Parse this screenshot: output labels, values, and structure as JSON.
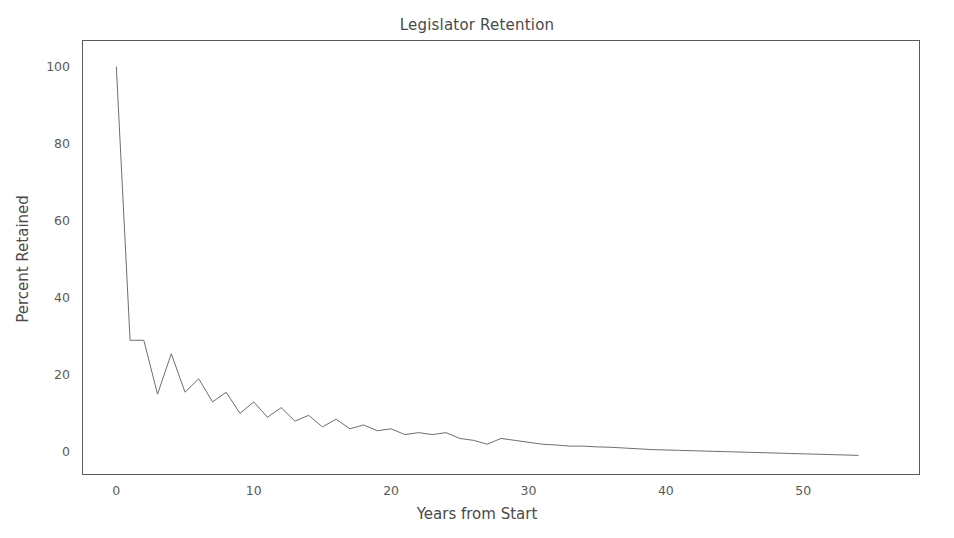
{
  "chart_data": {
    "type": "line",
    "title": "Legislator Retention",
    "xlabel": "Years from Start",
    "ylabel": "Percent Retained",
    "xlim": [
      -2.5,
      58.5
    ],
    "ylim": [
      -6,
      107
    ],
    "grid": false,
    "legend": null,
    "line_color": "#6e6e6e",
    "line_width": 1,
    "xticks": [
      0,
      10,
      20,
      30,
      40,
      50
    ],
    "xtick_labels": [
      "0",
      "10",
      "20",
      "30",
      "40",
      "50"
    ],
    "yticks": [
      0,
      20,
      40,
      60,
      80,
      100
    ],
    "ytick_labels": [
      "0",
      "20",
      "40",
      "60",
      "80",
      "100"
    ],
    "series": [
      {
        "name": "Percent Retained",
        "x": [
          0,
          1,
          2,
          3,
          4,
          5,
          6,
          7,
          8,
          9,
          10,
          11,
          12,
          13,
          14,
          15,
          16,
          17,
          18,
          19,
          20,
          21,
          22,
          23,
          24,
          25,
          26,
          27,
          28,
          29,
          30,
          31,
          32,
          33,
          34,
          35,
          36,
          37,
          38,
          39,
          40,
          41,
          42,
          43,
          44,
          45,
          46,
          47,
          48,
          49,
          50,
          51,
          52,
          53,
          54
        ],
        "values": [
          100.0,
          29.0,
          29.0,
          15.0,
          25.5,
          15.5,
          19.0,
          13.0,
          15.5,
          10.0,
          13.0,
          9.0,
          11.5,
          8.0,
          9.5,
          6.5,
          8.5,
          6.0,
          7.0,
          5.5,
          6.0,
          4.5,
          5.0,
          4.5,
          5.0,
          3.5,
          3.0,
          2.0,
          3.5,
          3.0,
          2.5,
          2.0,
          1.8,
          1.5,
          1.5,
          1.3,
          1.2,
          1.0,
          0.8,
          0.6,
          0.5,
          0.4,
          0.3,
          0.2,
          0.1,
          0.0,
          -0.1,
          -0.2,
          -0.3,
          -0.4,
          -0.5,
          -0.6,
          -0.7,
          -0.8,
          -0.9
        ]
      }
    ]
  },
  "figure": {
    "background_color": "#ffffff",
    "axes_edge_color": "#5a5a5a"
  }
}
